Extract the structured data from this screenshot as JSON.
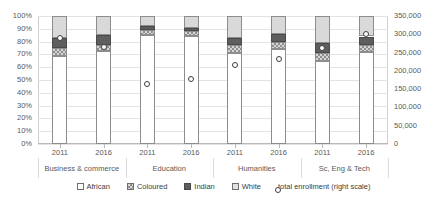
{
  "chart_data": {
    "type": "bar",
    "subtype": "stacked-percent-bar-with-line-markers",
    "title": "",
    "xlabel": "",
    "ylabel": "",
    "y_left": {
      "label": "",
      "ticks": [
        "0%",
        "10%",
        "20%",
        "30%",
        "40%",
        "50%",
        "60%",
        "70%",
        "80%",
        "90%",
        "100%"
      ],
      "min": 0,
      "max": 100,
      "step": 10
    },
    "y_right": {
      "label": "total enrollment (right scale)",
      "ticks": [
        "0",
        "50,000",
        "100,000",
        "150,000",
        "200,000",
        "250,000",
        "300,000",
        "350,000"
      ],
      "min": 0,
      "max": 350000,
      "step": 50000
    },
    "grid": true,
    "legend_position": "bottom",
    "groups": [
      {
        "label": "Business & commerce",
        "years": [
          "2011",
          "2016"
        ]
      },
      {
        "label": "Education",
        "years": [
          "2011",
          "2016"
        ]
      },
      {
        "label": "Humanities",
        "years": [
          "2011",
          "2016"
        ]
      },
      {
        "label": "Sc, Eng & Tech",
        "years": [
          "2011",
          "2016"
        ]
      }
    ],
    "categories": [
      "Business & commerce 2011",
      "Business & commerce 2016",
      "Education 2011",
      "Education 2016",
      "Humanities 2011",
      "Humanities 2016",
      "Sc, Eng & Tech 2011",
      "Sc, Eng & Tech 2016"
    ],
    "series": [
      {
        "name": "African",
        "values": [
          69,
          73,
          85,
          84,
          71,
          74,
          65,
          72
        ]
      },
      {
        "name": "Coloured",
        "values": [
          6,
          4,
          4,
          4,
          6,
          6,
          6,
          5
        ]
      },
      {
        "name": "Indian",
        "values": [
          8,
          8,
          3,
          3,
          6,
          6,
          8,
          7
        ]
      },
      {
        "name": "White",
        "values": [
          17,
          15,
          8,
          9,
          17,
          14,
          21,
          16
        ]
      }
    ],
    "marker_series": {
      "name": "total enrollment (right scale)",
      "axis": "right",
      "values": [
        290000,
        265000,
        165000,
        178000,
        215000,
        232000,
        262000,
        300000
      ]
    }
  },
  "legend": {
    "items": [
      {
        "key": "african",
        "label": "African"
      },
      {
        "key": "coloured",
        "label": "Coloured"
      },
      {
        "key": "indian",
        "label": "Indian"
      },
      {
        "key": "white",
        "label": "White"
      },
      {
        "key": "marker",
        "label": "total enrollment (right scale)"
      }
    ]
  }
}
